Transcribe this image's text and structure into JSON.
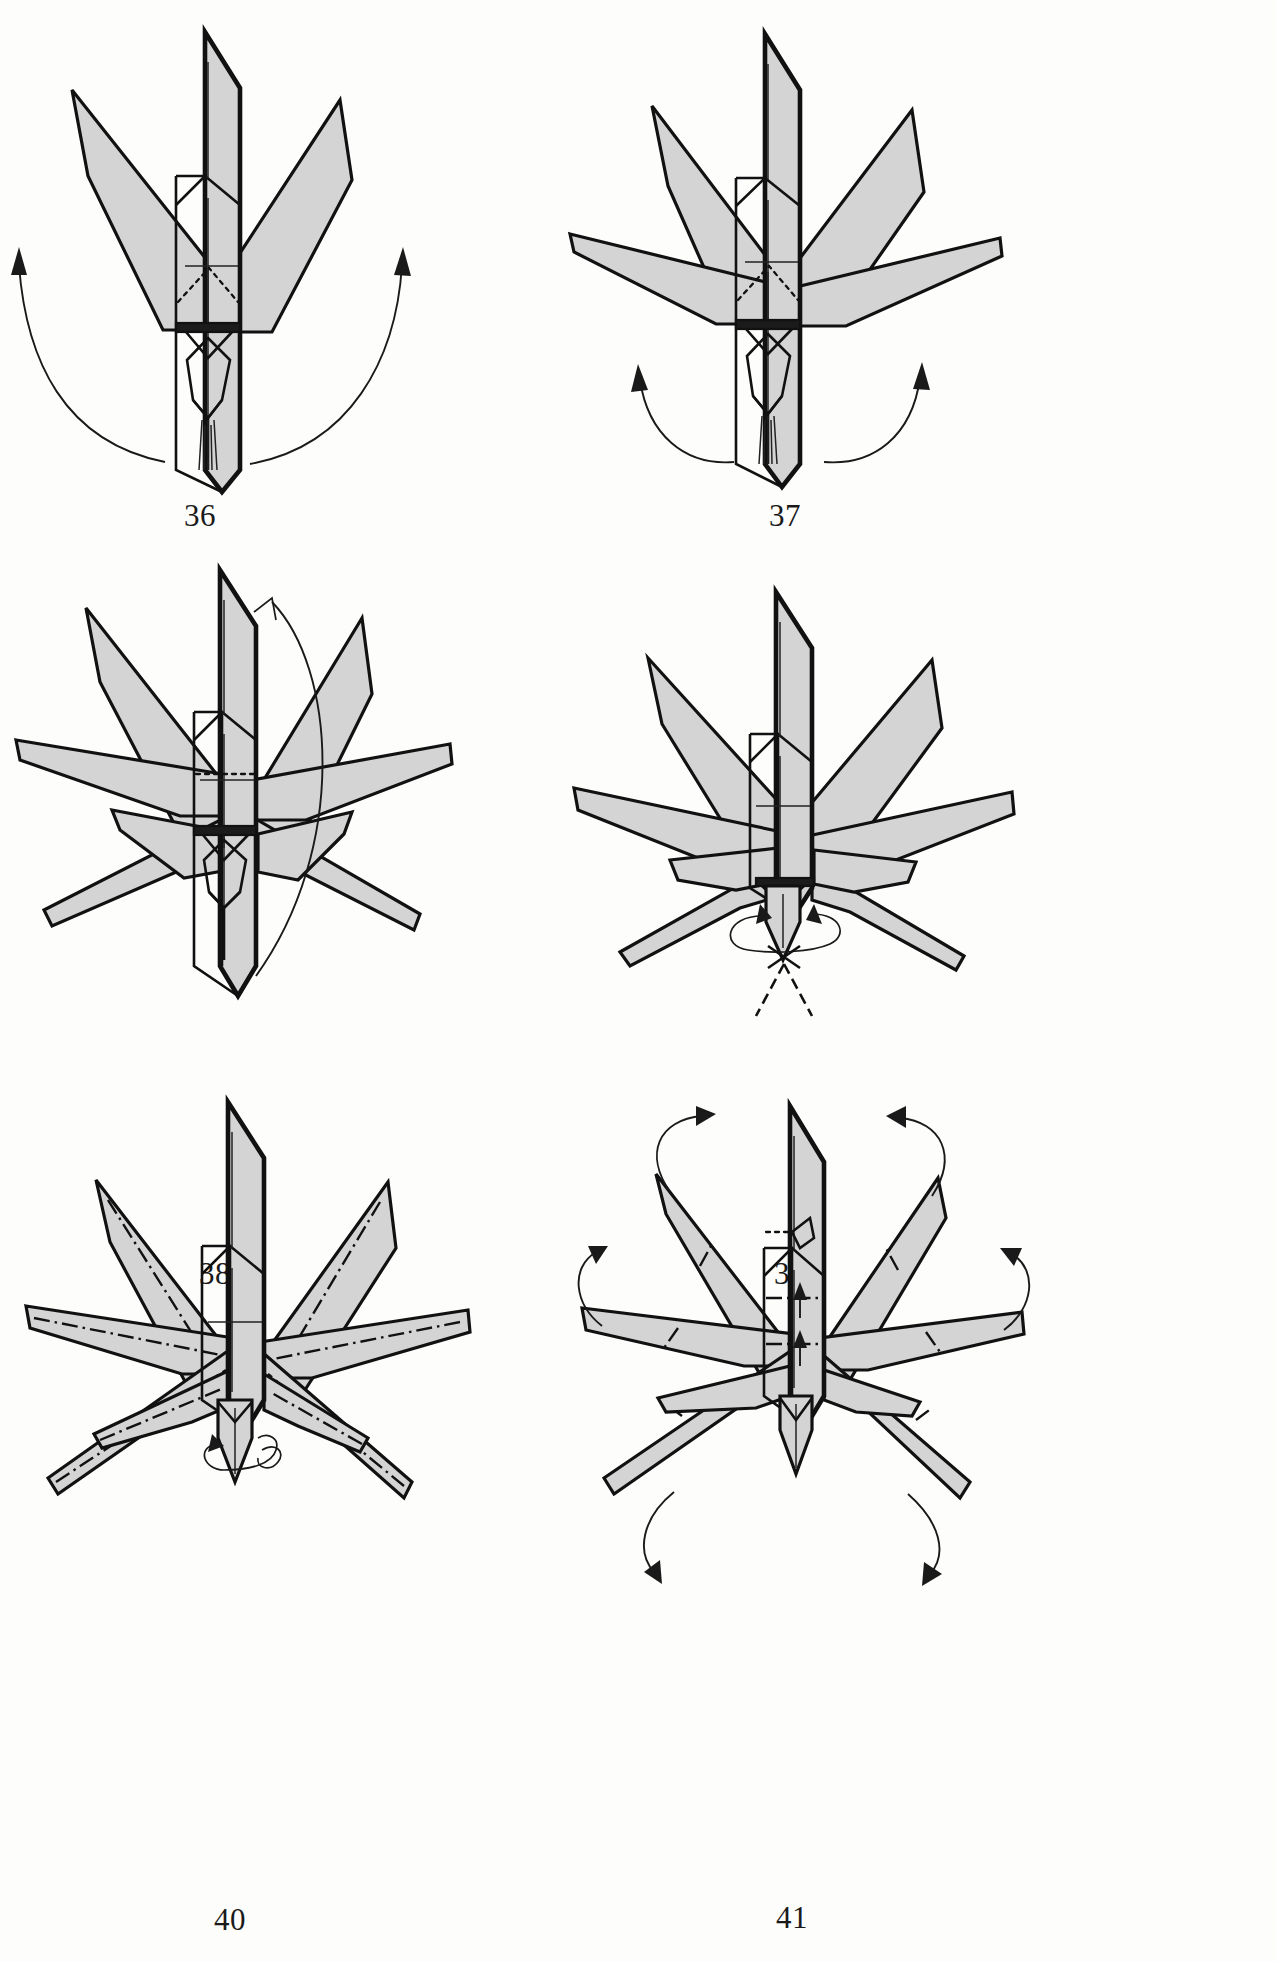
{
  "page": {
    "kind": "origami-instruction-diagram-page",
    "background_color": "#fdfdfc",
    "paper_fill_color": "#d4d4d4",
    "line_color": "#111111",
    "width": 1276,
    "height": 1962,
    "columns": 2,
    "rows": 3
  },
  "legend": {
    "solid_line": "paper edge",
    "thin_solid_line": "existing crease",
    "dotted_line": "hidden / X-ray edge",
    "dash_dot_line": "mountain fold",
    "dashed_line": "hidden edge behind",
    "arrow": "fold direction",
    "looped_arrow": "twist / rotate"
  },
  "figures": [
    {
      "id": "fig-36",
      "number": "36",
      "row": 1,
      "column": 1,
      "caption": "36",
      "description": "Narrow vertical body with two slender points swung up to the sides; two long curved arrows sweep outward and upward from the base.",
      "point_count": 2,
      "arrows": [
        {
          "name": "swing-left-point-up",
          "type": "curved-arrow",
          "direction": "up-left"
        },
        {
          "name": "swing-right-point-up",
          "type": "curved-arrow",
          "direction": "up-right"
        }
      ]
    },
    {
      "id": "fig-37",
      "number": "37",
      "row": 1,
      "column": 2,
      "caption": "37",
      "description": "Same model with four points raised; a second pair of long horizontal points now extends to left and right. Two curved arrows at the base swing the next pair outward.",
      "point_count": 4,
      "arrows": [
        {
          "name": "swing-left-point-up",
          "type": "curved-arrow",
          "direction": "up-left"
        },
        {
          "name": "swing-right-point-up",
          "type": "curved-arrow",
          "direction": "up-right"
        }
      ]
    },
    {
      "id": "fig-38",
      "number": "38",
      "row": 2,
      "column": 1,
      "caption": "38",
      "description": "Eight points now radiate symmetrically around the central body. A tall curved arrow on the right indicates turning the model over / rotating it.",
      "point_count": 8,
      "arrows": [
        {
          "name": "turn-over-arrow",
          "type": "curved-arrow",
          "direction": "up"
        }
      ]
    },
    {
      "id": "fig-39",
      "number": "39",
      "row": 2,
      "column": 2,
      "caption": "39",
      "description": "Model after turning over: eight points spread out and slightly swept down. A looped twist arrow encircles the narrow tail at the bottom; dashed lines show the hidden tail flaps.",
      "point_count": 8,
      "arrows": [
        {
          "name": "twist-tail-arrow",
          "type": "loop-arrow",
          "direction": "clockwise"
        }
      ]
    },
    {
      "id": "fig-40",
      "number": "40",
      "row": 3,
      "column": 1,
      "caption": "40",
      "description": "Eight spread points each marked with a long dash-dot mountain-fold line running lengthwise. A small loop arrow at the tail shows a twist.",
      "point_count": 8,
      "fold_marks": "dash-dot mountain fold along each point",
      "arrows": [
        {
          "name": "twist-tail-arrow",
          "type": "loop-arrow",
          "direction": "clockwise"
        }
      ]
    },
    {
      "id": "fig-41",
      "number": "41",
      "row": 3,
      "column": 2,
      "caption": "41",
      "description": "Points narrowed by the mountain folds. Six curved arrows around the outside swing the points up and down; dash-dot marks and small arrows on the body indicate further pleating.",
      "point_count": 8,
      "arrows": [
        {
          "name": "swing-upper-left-arrow",
          "type": "curved-arrow",
          "direction": "up-right"
        },
        {
          "name": "swing-upper-right-arrow",
          "type": "curved-arrow",
          "direction": "up-left"
        },
        {
          "name": "swing-middle-left-arrow",
          "type": "curved-arrow",
          "direction": "up"
        },
        {
          "name": "swing-middle-right-arrow",
          "type": "curved-arrow",
          "direction": "up"
        },
        {
          "name": "swing-lower-left-arrow",
          "type": "curved-arrow",
          "direction": "down-left"
        },
        {
          "name": "swing-lower-right-arrow",
          "type": "curved-arrow",
          "direction": "down-right"
        },
        {
          "name": "pleat-body-arrow-upper",
          "type": "straight-arrow",
          "direction": "up"
        },
        {
          "name": "pleat-body-arrow-lower",
          "type": "straight-arrow",
          "direction": "up"
        }
      ]
    }
  ]
}
